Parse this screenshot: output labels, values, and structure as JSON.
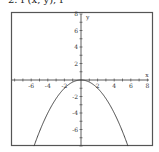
{
  "header": {
    "text": "2. f (x, y), f"
  },
  "chart_data": {
    "type": "line",
    "title": "",
    "xlabel": "x",
    "ylabel": "y",
    "xlim": [
      -7.5,
      8
    ],
    "ylim": [
      -8,
      8
    ],
    "grid": false,
    "x_tick_labels": [
      "-6",
      "-4",
      "-2",
      "2",
      "4",
      "6",
      "8"
    ],
    "y_tick_labels": [
      "8",
      "6",
      "4",
      "2",
      "-2",
      "-4",
      "-6"
    ],
    "series": [
      {
        "name": "y = -x^2/4",
        "function": "-x^2/4",
        "x": [
          -5.66,
          -5,
          -4,
          -3,
          -2,
          -1,
          0,
          1,
          2,
          3,
          4,
          5,
          5.66
        ],
        "y": [
          -8,
          -6.25,
          -4,
          -2.25,
          -1,
          -0.25,
          0,
          -0.25,
          -1,
          -2.25,
          -4,
          -6.25,
          -8
        ]
      }
    ],
    "colors": {
      "frame": "#555555",
      "axis": "#333333",
      "curve": "#333333"
    }
  }
}
